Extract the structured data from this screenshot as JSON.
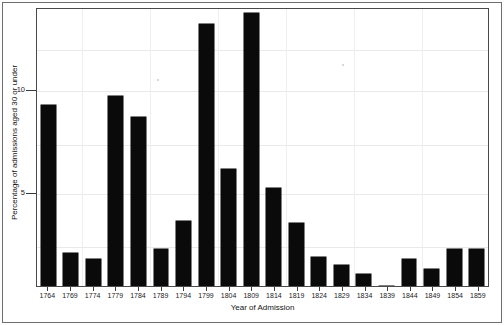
{
  "chart_data": {
    "type": "bar",
    "title": "",
    "xlabel": "Year of Admission",
    "ylabel": "Percentage of admissions aged 30 or under",
    "categories": [
      "1764",
      "1769",
      "1774",
      "1779",
      "1784",
      "1789",
      "1794",
      "1799",
      "1804",
      "1809",
      "1814",
      "1819",
      "1824",
      "1829",
      "1834",
      "1839",
      "1844",
      "1849",
      "1854",
      "1859"
    ],
    "values": [
      9.4,
      1.7,
      1.4,
      9.9,
      8.8,
      1.9,
      3.4,
      13.6,
      6.1,
      14.2,
      5.1,
      3.3,
      1.5,
      1.1,
      0.6,
      0.0,
      1.4,
      0.9,
      1.9,
      1.9
    ],
    "ytick_values": [
      5,
      10
    ],
    "ytick_labels": [
      "5",
      "10"
    ],
    "ylim": [
      0,
      14.4
    ],
    "xlim_note": "categorical 5-year bins from 1764 to 1859",
    "grid": true,
    "legend": null,
    "bar_color": "#0a0a0a",
    "background_color": "#ffffff"
  },
  "axes": {
    "y_title": "Percentage of admissions aged 30 or under",
    "x_title": "Year of Admission",
    "y_ticks": [
      {
        "label": "10",
        "value": 10
      },
      {
        "label": "5",
        "value": 5
      }
    ]
  }
}
